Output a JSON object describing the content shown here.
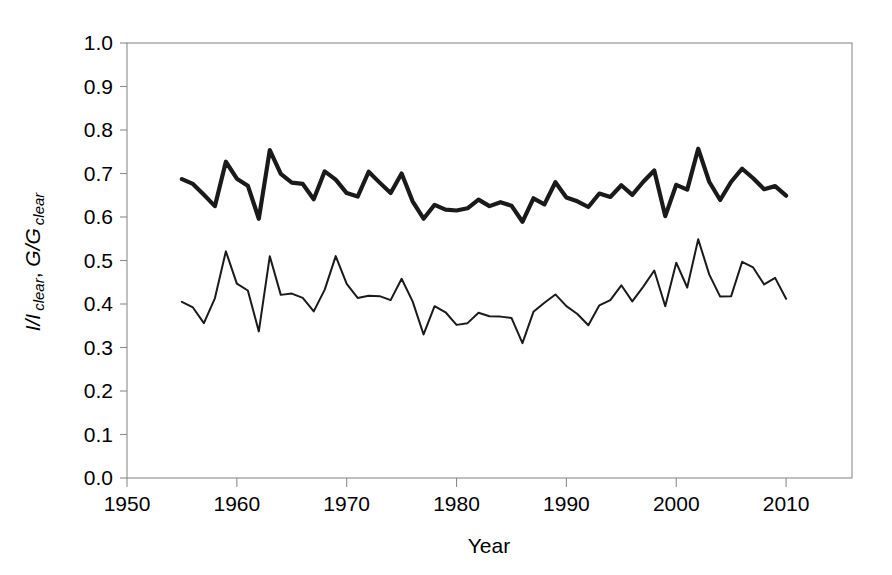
{
  "chart_data": {
    "type": "line",
    "title": "",
    "xlabel": "Year",
    "ylabel": "I/I clear, G/G clear",
    "ylabel_parts": {
      "part1_main": "I/I",
      "part1_sub": "clear",
      "separator": ", ",
      "part2_main": "G/G",
      "part2_sub": "clear"
    },
    "xlim": [
      1950,
      2016
    ],
    "ylim": [
      0.0,
      1.0
    ],
    "xticks": [
      1950,
      1960,
      1970,
      1980,
      1990,
      2000,
      2010
    ],
    "xtick_labels": [
      "1950",
      "1960",
      "1970",
      "1980",
      "1990",
      "2000",
      "2010"
    ],
    "yticks": [
      0.0,
      0.1,
      0.2,
      0.3,
      0.4,
      0.5,
      0.6,
      0.7,
      0.8,
      0.9,
      1.0
    ],
    "ytick_labels": [
      "0.0",
      "0.1",
      "0.2",
      "0.3",
      "0.4",
      "0.5",
      "0.6",
      "0.7",
      "0.8",
      "0.9",
      "1.0"
    ],
    "grid": false,
    "legend": "none",
    "line_color": "#1a1a1a",
    "frame_color": "#8c8c8c",
    "x": [
      1955,
      1956,
      1957,
      1958,
      1959,
      1960,
      1961,
      1962,
      1963,
      1964,
      1965,
      1966,
      1967,
      1968,
      1969,
      1970,
      1971,
      1972,
      1973,
      1974,
      1975,
      1976,
      1977,
      1978,
      1979,
      1980,
      1981,
      1982,
      1983,
      1984,
      1985,
      1986,
      1987,
      1988,
      1989,
      1990,
      1991,
      1992,
      1993,
      1994,
      1995,
      1996,
      1997,
      1998,
      1999,
      2000,
      2001,
      2002,
      2003,
      2004,
      2005,
      2006,
      2007,
      2008,
      2009,
      2010
    ],
    "series": [
      {
        "name": "G/G clear",
        "style": "thick",
        "stroke_width": 4.2,
        "values": [
          0.687,
          0.676,
          0.651,
          0.625,
          0.727,
          0.688,
          0.672,
          0.596,
          0.754,
          0.699,
          0.679,
          0.676,
          0.641,
          0.705,
          0.686,
          0.655,
          0.647,
          0.704,
          0.679,
          0.655,
          0.7,
          0.636,
          0.596,
          0.628,
          0.617,
          0.615,
          0.62,
          0.64,
          0.625,
          0.634,
          0.626,
          0.589,
          0.643,
          0.629,
          0.68,
          0.645,
          0.636,
          0.623,
          0.654,
          0.646,
          0.673,
          0.651,
          0.681,
          0.707,
          0.602,
          0.674,
          0.663,
          0.757,
          0.681,
          0.639,
          0.681,
          0.711,
          0.689,
          0.664,
          0.671,
          0.649
        ]
      },
      {
        "name": "I/I clear",
        "style": "thin",
        "stroke_width": 2.0,
        "values": [
          0.405,
          0.392,
          0.356,
          0.413,
          0.521,
          0.447,
          0.431,
          0.337,
          0.51,
          0.421,
          0.424,
          0.414,
          0.383,
          0.433,
          0.51,
          0.446,
          0.414,
          0.419,
          0.418,
          0.409,
          0.458,
          0.406,
          0.33,
          0.395,
          0.381,
          0.352,
          0.356,
          0.38,
          0.372,
          0.371,
          0.368,
          0.31,
          0.382,
          0.403,
          0.422,
          0.395,
          0.377,
          0.351,
          0.397,
          0.409,
          0.443,
          0.406,
          0.44,
          0.477,
          0.395,
          0.495,
          0.438,
          0.549,
          0.468,
          0.417,
          0.418,
          0.497,
          0.484,
          0.445,
          0.46,
          0.412
        ]
      }
    ]
  }
}
